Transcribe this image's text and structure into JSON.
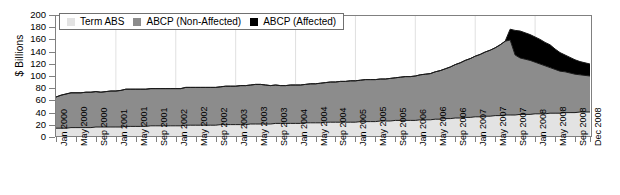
{
  "chart_data": {
    "type": "area",
    "stacked": true,
    "title": "",
    "xlabel": "",
    "ylabel": "$ Billions",
    "ylim": [
      0,
      200
    ],
    "ytick_step": 20,
    "ytick_labels": [
      "0",
      "20",
      "40",
      "60",
      "80",
      "100",
      "120",
      "140",
      "160",
      "180",
      "200"
    ],
    "grid": "vertical-faint-annual",
    "legend_position": "top-left-inside",
    "colors": {
      "term_abs": "#e3e3e3",
      "abcp_non_affected": "#8c8c8c",
      "abcp_affected": "#000000",
      "axis": "#808080",
      "outline": "#1a1a1a"
    },
    "xtick_labels": [
      "Jan 2000",
      "May 2000",
      "Sep 2000",
      "Jan 2001",
      "May 2001",
      "Sep 2001",
      "Jan 2002",
      "May 2002",
      "Sep 2002",
      "Jan 2003",
      "May 2003",
      "Sep 2003",
      "Jan 2004",
      "May 2004",
      "Sep 2004",
      "Jan 2005",
      "May 2005",
      "Sep 2005",
      "Jan 2006",
      "May 2006",
      "Sep 2006",
      "Jan 2007",
      "May 2007",
      "Sep 2007",
      "Jan 2008",
      "May 2008",
      "Sep 2008",
      "Dec 2008"
    ],
    "x": [
      "Jan 2000",
      "Feb 2000",
      "Mar 2000",
      "Apr 2000",
      "May 2000",
      "Jun 2000",
      "Jul 2000",
      "Aug 2000",
      "Sep 2000",
      "Oct 2000",
      "Nov 2000",
      "Dec 2000",
      "Jan 2001",
      "Feb 2001",
      "Mar 2001",
      "Apr 2001",
      "May 2001",
      "Jun 2001",
      "Jul 2001",
      "Aug 2001",
      "Sep 2001",
      "Oct 2001",
      "Nov 2001",
      "Dec 2001",
      "Jan 2002",
      "Feb 2002",
      "Mar 2002",
      "Apr 2002",
      "May 2002",
      "Jun 2002",
      "Jul 2002",
      "Aug 2002",
      "Sep 2002",
      "Oct 2002",
      "Nov 2002",
      "Dec 2002",
      "Jan 2003",
      "Feb 2003",
      "Mar 2003",
      "Apr 2003",
      "May 2003",
      "Jun 2003",
      "Jul 2003",
      "Aug 2003",
      "Sep 2003",
      "Oct 2003",
      "Nov 2003",
      "Dec 2003",
      "Jan 2004",
      "Feb 2004",
      "Mar 2004",
      "Apr 2004",
      "May 2004",
      "Jun 2004",
      "Jul 2004",
      "Aug 2004",
      "Sep 2004",
      "Oct 2004",
      "Nov 2004",
      "Dec 2004",
      "Jan 2005",
      "Feb 2005",
      "Mar 2005",
      "Apr 2005",
      "May 2005",
      "Jun 2005",
      "Jul 2005",
      "Aug 2005",
      "Sep 2005",
      "Oct 2005",
      "Nov 2005",
      "Dec 2005",
      "Jan 2006",
      "Feb 2006",
      "Mar 2006",
      "Apr 2006",
      "May 2006",
      "Jun 2006",
      "Jul 2006",
      "Aug 2006",
      "Sep 2006",
      "Oct 2006",
      "Nov 2006",
      "Dec 2006",
      "Jan 2007",
      "Feb 2007",
      "Mar 2007",
      "Apr 2007",
      "May 2007",
      "Jun 2007",
      "Jul 2007",
      "Aug 2007",
      "Sep 2007",
      "Oct 2007",
      "Nov 2007",
      "Dec 2007",
      "Jan 2008",
      "Feb 2008",
      "Mar 2008",
      "Apr 2008",
      "May 2008",
      "Jun 2008",
      "Jul 2008",
      "Aug 2008",
      "Sep 2008",
      "Oct 2008",
      "Nov 2008",
      "Dec 2008"
    ],
    "series": [
      {
        "name": "Term ABS",
        "color": "#e3e3e3",
        "values": [
          13,
          13,
          13,
          14,
          14,
          14,
          14,
          14,
          15,
          15,
          15,
          15,
          15,
          15,
          16,
          16,
          16,
          16,
          16,
          17,
          17,
          17,
          17,
          17,
          17,
          17,
          18,
          18,
          18,
          18,
          18,
          18,
          18,
          19,
          19,
          19,
          19,
          19,
          19,
          20,
          20,
          20,
          20,
          20,
          21,
          21,
          21,
          21,
          21,
          21,
          22,
          22,
          22,
          22,
          23,
          23,
          23,
          23,
          23,
          23,
          23,
          24,
          24,
          24,
          24,
          25,
          25,
          25,
          26,
          26,
          26,
          26,
          26,
          27,
          27,
          27,
          28,
          28,
          29,
          29,
          30,
          30,
          31,
          31,
          32,
          32,
          33,
          33,
          34,
          34,
          35,
          35,
          35,
          36,
          36,
          36,
          37,
          37,
          37,
          38,
          38,
          38,
          39,
          39,
          39,
          40,
          40,
          40
        ]
      },
      {
        "name": "ABCP (Non-Affected)",
        "color": "#8c8c8c",
        "values": [
          52,
          55,
          57,
          58,
          58,
          58,
          59,
          59,
          59,
          58,
          59,
          60,
          60,
          61,
          62,
          62,
          62,
          62,
          62,
          62,
          62,
          62,
          62,
          62,
          62,
          62,
          63,
          63,
          63,
          63,
          63,
          63,
          63,
          63,
          64,
          64,
          64,
          65,
          65,
          65,
          66,
          66,
          65,
          64,
          64,
          63,
          63,
          64,
          64,
          64,
          64,
          65,
          65,
          66,
          66,
          67,
          67,
          68,
          68,
          69,
          69,
          69,
          70,
          70,
          70,
          70,
          70,
          71,
          71,
          72,
          73,
          73,
          74,
          75,
          76,
          77,
          79,
          81,
          83,
          86,
          89,
          92,
          95,
          98,
          101,
          104,
          107,
          110,
          113,
          118,
          123,
          125,
          100,
          94,
          92,
          90,
          86,
          83,
          80,
          76,
          73,
          70,
          68,
          66,
          64,
          62,
          61,
          60
        ]
      },
      {
        "name": "ABCP (Affected)",
        "color": "#000000",
        "values": [
          0,
          0,
          0,
          0,
          0,
          0,
          0,
          0,
          0,
          0,
          0,
          0,
          0,
          0,
          0,
          0,
          0,
          0,
          0,
          0,
          0,
          0,
          0,
          0,
          0,
          0,
          0,
          0,
          0,
          0,
          0,
          0,
          0,
          0,
          0,
          0,
          0,
          0,
          0,
          0,
          0,
          0,
          0,
          0,
          0,
          0,
          0,
          0,
          0,
          0,
          0,
          0,
          0,
          0,
          0,
          0,
          0,
          0,
          0,
          0,
          0,
          0,
          0,
          0,
          0,
          0,
          0,
          0,
          0,
          0,
          0,
          0,
          0,
          0,
          0,
          0,
          0,
          0,
          0,
          0,
          0,
          0,
          0,
          0,
          0,
          0,
          0,
          0,
          0,
          0,
          0,
          18,
          41,
          45,
          44,
          43,
          42,
          41,
          39,
          38,
          34,
          31,
          28,
          26,
          24,
          22,
          21,
          20
        ]
      }
    ]
  },
  "legend": {
    "items": [
      {
        "label": "Term ABS",
        "color": "#e3e3e3"
      },
      {
        "label": "ABCP (Non-Affected)",
        "color": "#8c8c8c"
      },
      {
        "label": "ABCP (Affected)",
        "color": "#000000"
      }
    ]
  },
  "axes": {
    "y_title": "$ Billions"
  }
}
